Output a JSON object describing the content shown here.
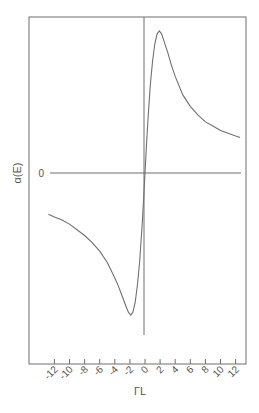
{
  "chart_data": {
    "type": "line",
    "title": "",
    "xlabel": "ΓL",
    "ylabel": "α(E)",
    "xlim": [
      -13,
      13
    ],
    "ylim": [
      -1.1,
      1.1
    ],
    "grid": false,
    "legend": null,
    "x_ticks": [
      -12,
      -10,
      -8,
      -6,
      -4,
      -2,
      0,
      2,
      4,
      6,
      8,
      10,
      12
    ],
    "x_tick_labels": [
      "-12",
      "-10",
      "-8",
      "-6",
      "-4",
      "-2",
      "0",
      "2",
      "4",
      "6",
      "8",
      "10",
      "12"
    ],
    "y_ticks": [
      0
    ],
    "y_tick_labels": [
      "0"
    ],
    "annotations": [
      "horizontal zero line",
      "vertical line at ΓL = 0"
    ],
    "series": [
      {
        "name": "α(E)",
        "x": [
          -12.8,
          -12,
          -11,
          -10,
          -9,
          -8,
          -7,
          -6,
          -5,
          -4,
          -3.5,
          -3,
          -2.5,
          -2.2,
          -1.9,
          -1.6,
          -1.3,
          -1,
          -0.7,
          -0.4,
          -0.2,
          0,
          0.2,
          0.4,
          0.7,
          1,
          1.3,
          1.6,
          1.9,
          2.2,
          2.5,
          3,
          3.5,
          4,
          5,
          6,
          7,
          8,
          9,
          10,
          11,
          12,
          12.6
        ],
        "values": [
          -0.29,
          -0.31,
          -0.33,
          -0.36,
          -0.4,
          -0.44,
          -0.49,
          -0.55,
          -0.63,
          -0.74,
          -0.8,
          -0.87,
          -0.94,
          -0.98,
          -1.0,
          -0.98,
          -0.91,
          -0.79,
          -0.62,
          -0.38,
          -0.2,
          0.0,
          0.2,
          0.38,
          0.62,
          0.79,
          0.91,
          0.98,
          1.0,
          0.98,
          0.93,
          0.85,
          0.76,
          0.68,
          0.55,
          0.47,
          0.41,
          0.36,
          0.33,
          0.3,
          0.28,
          0.26,
          0.25
        ]
      }
    ]
  }
}
